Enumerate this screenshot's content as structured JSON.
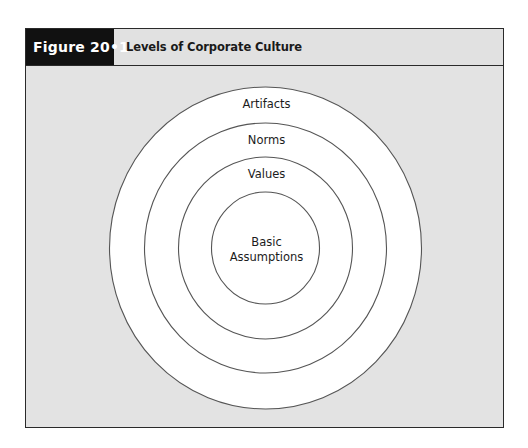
{
  "figure": {
    "label": "Figure 20•1",
    "title": "Levels of Corporate Culture"
  },
  "diagram": {
    "type": "concentric-circles",
    "center": {
      "x": 265.5,
      "y": 248
    },
    "stroke_color": "#555555",
    "fill_color": "#ffffff",
    "background_color": "#e3e3e3",
    "levels": [
      {
        "label": "Artifacts",
        "rx": 156,
        "ry": 161,
        "label_y": 108
      },
      {
        "label": "Norms",
        "rx": 121,
        "ry": 125,
        "label_y": 144
      },
      {
        "label": "Values",
        "rx": 87,
        "ry": 91,
        "label_y": 178
      },
      {
        "label_lines": [
          "Basic",
          "Assumptions"
        ],
        "label": "Basic Assumptions",
        "rx": 54,
        "ry": 56,
        "label_y": 246
      }
    ]
  },
  "colors": {
    "frame_border": "#2a2a2a",
    "label_background": "#111111",
    "label_text": "#ffffff",
    "header_background": "#e1e1e1"
  }
}
